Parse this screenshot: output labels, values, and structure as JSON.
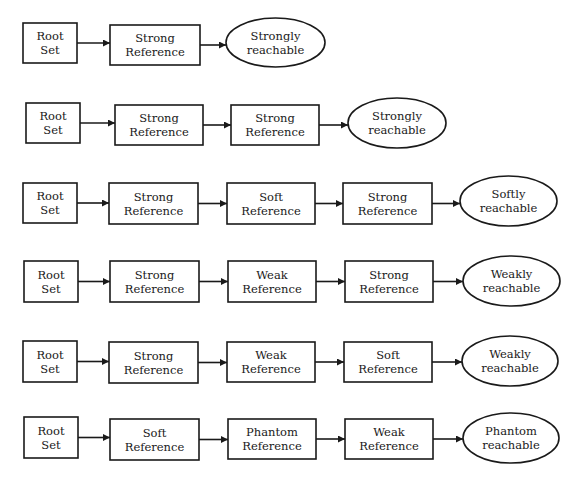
{
  "diagram": {
    "rows": [
      {
        "nodes": [
          {
            "type": "box",
            "lines": [
              "Root",
              "Set"
            ]
          },
          {
            "type": "box",
            "lines": [
              "Strong",
              "Reference"
            ]
          },
          {
            "type": "ellipse",
            "lines": [
              "Strongly",
              "reachable"
            ]
          }
        ]
      },
      {
        "nodes": [
          {
            "type": "box",
            "lines": [
              "Root",
              "Set"
            ]
          },
          {
            "type": "box",
            "lines": [
              "Strong",
              "Reference"
            ]
          },
          {
            "type": "box",
            "lines": [
              "Strong",
              "Reference"
            ]
          },
          {
            "type": "ellipse",
            "lines": [
              "Strongly",
              "reachable"
            ]
          }
        ]
      },
      {
        "nodes": [
          {
            "type": "box",
            "lines": [
              "Root",
              "Set"
            ]
          },
          {
            "type": "box",
            "lines": [
              "Strong",
              "Reference"
            ]
          },
          {
            "type": "box",
            "lines": [
              "Soft",
              "Reference"
            ]
          },
          {
            "type": "box",
            "lines": [
              "Strong",
              "Reference"
            ]
          },
          {
            "type": "ellipse",
            "lines": [
              "Softly",
              "reachable"
            ]
          }
        ]
      },
      {
        "nodes": [
          {
            "type": "box",
            "lines": [
              "Root",
              "Set"
            ]
          },
          {
            "type": "box",
            "lines": [
              "Strong",
              "Reference"
            ]
          },
          {
            "type": "box",
            "lines": [
              "Weak",
              "Reference"
            ]
          },
          {
            "type": "box",
            "lines": [
              "Strong",
              "Reference"
            ]
          },
          {
            "type": "ellipse",
            "lines": [
              "Weakly",
              "reachable"
            ]
          }
        ]
      },
      {
        "nodes": [
          {
            "type": "box",
            "lines": [
              "Root",
              "Set"
            ]
          },
          {
            "type": "box",
            "lines": [
              "Strong",
              "Reference"
            ]
          },
          {
            "type": "box",
            "lines": [
              "Weak",
              "Reference"
            ]
          },
          {
            "type": "box",
            "lines": [
              "Soft",
              "Reference"
            ]
          },
          {
            "type": "ellipse",
            "lines": [
              "Weakly",
              "reachable"
            ]
          }
        ]
      },
      {
        "nodes": [
          {
            "type": "box",
            "lines": [
              "Root",
              "Set"
            ]
          },
          {
            "type": "box",
            "lines": [
              "Soft",
              "Reference"
            ]
          },
          {
            "type": "box",
            "lines": [
              "Phantom",
              "Reference"
            ]
          },
          {
            "type": "box",
            "lines": [
              "Weak",
              "Reference"
            ]
          },
          {
            "type": "ellipse",
            "lines": [
              "Phantom",
              "reachable"
            ]
          }
        ]
      }
    ]
  }
}
